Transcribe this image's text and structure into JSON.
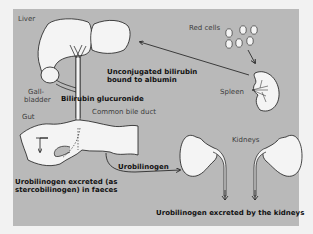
{
  "figure": {
    "labels": {
      "liver": "Liver",
      "red_cells": "Red cells",
      "spleen": "Spleen",
      "unconjugated_line1": "Unconjugated bilirubin",
      "unconjugated_line2": "bound to albumin",
      "gallbladder_line1": "Gall-",
      "gallbladder_line2": "bladder",
      "bilirubin_glucuronide": "Bilirubin glucuronide",
      "common_bile_duct": "Common bile duct",
      "gut": "Gut",
      "urobilinogen": "Urobilinogen",
      "kidneys": "Kidneys",
      "faeces_line1": "Urobilinogen excreted (as",
      "faeces_line2": "stercobilinogen) in faeces",
      "kidney_excretion": "Urobilinogen excreted by the kidneys"
    },
    "colors": {
      "panel": "#b9b9b9",
      "organ_fill": "#f4f4f4",
      "outline": "#1a1a1a"
    }
  }
}
